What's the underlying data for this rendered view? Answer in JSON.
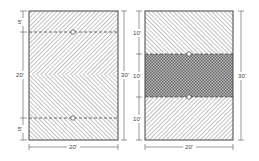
{
  "figure": {
    "left_panel": {
      "segments_left": [
        {
          "label": "5'",
          "feet": 5
        },
        {
          "label": "20'",
          "feet": 20
        },
        {
          "label": "5'",
          "feet": 5
        }
      ],
      "height_label": "30'",
      "width_label": "20'",
      "pattern": "diagonal hatching with herringbone chevron at center",
      "markers": 2
    },
    "right_panel": {
      "segments_left": [
        {
          "label": "10'",
          "feet": 10
        },
        {
          "label": "10'",
          "feet": 10
        },
        {
          "label": "10'",
          "feet": 10
        }
      ],
      "height_label": "30'",
      "width_label": "20'",
      "pattern": "diagonal hatching top/bottom, cross-hatched middle band",
      "markers": 2
    },
    "colors": {
      "line": "#555555",
      "background": "#ffffff"
    }
  }
}
